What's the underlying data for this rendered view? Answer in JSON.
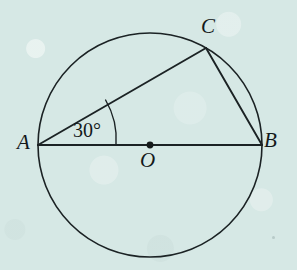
{
  "figure": {
    "kind": "geometry-diagram",
    "background_color": "#d6e8e5",
    "stroke_color": "#1b2224",
    "label_color": "#14191a",
    "width": 297,
    "height": 270
  },
  "circle": {
    "name": "main-circle",
    "center_x": 150,
    "center_y": 145,
    "radius": 112,
    "stroke_width": 1.6
  },
  "points": [
    {
      "id": "A",
      "label": "A",
      "x": 38,
      "y": 145,
      "label_x": 27,
      "label_y": 143,
      "dot": false
    },
    {
      "id": "B",
      "label": "B",
      "x": 262,
      "y": 145,
      "label_x": 273,
      "label_y": 141,
      "dot": false
    },
    {
      "id": "C",
      "label": "C",
      "x": 206,
      "y": 48,
      "label_x": 211,
      "label_y": 27,
      "dot": false
    },
    {
      "id": "O",
      "label": "O",
      "x": 150,
      "y": 145,
      "label_x": 148,
      "label_y": 161,
      "dot": true
    }
  ],
  "center_dot": {
    "name": "center-point-dot",
    "x": 150,
    "y": 145,
    "radius": 3.4,
    "fill": "#14191a"
  },
  "segments": [
    {
      "id": "AB",
      "from": "A",
      "to": "B",
      "x1": 38,
      "y1": 145,
      "x2": 262,
      "y2": 145,
      "role": "diameter",
      "stroke_width": 1.9
    },
    {
      "id": "AC",
      "from": "A",
      "to": "C",
      "x1": 38,
      "y1": 145,
      "x2": 206,
      "y2": 48,
      "role": "chord",
      "stroke_width": 1.9
    },
    {
      "id": "CB",
      "from": "C",
      "to": "B",
      "x1": 206,
      "y1": 48,
      "x2": 262,
      "y2": 145,
      "role": "chord",
      "stroke_width": 1.9
    }
  ],
  "angle_marker": {
    "name": "angle-arc-at-A",
    "vertex": "A",
    "value": "30°",
    "degrees": 30,
    "arc_radius": 78,
    "arc_path": "M 116 145 A 78 78 0 0 0 105.6 100.0",
    "stroke_width": 1.4
  },
  "labels": {
    "A": "A",
    "B": "B",
    "C": "C",
    "O": "O",
    "angle": "30°"
  }
}
